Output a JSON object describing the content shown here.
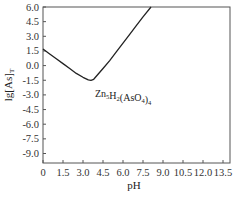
{
  "chart_data": {
    "type": "line",
    "title": "",
    "xlabel": "pH",
    "ylabel_main": "lg[As]",
    "ylabel_sub": "T",
    "xlim": [
      0,
      14.1
    ],
    "ylim": [
      -10.4,
      6.0
    ],
    "grid": false,
    "x_ticks": [
      "0",
      "1.5",
      "3.0",
      "4.5",
      "6.0",
      "7.5",
      "9.0",
      "10.5",
      "12.0",
      "13.5"
    ],
    "x_tick_values": [
      0,
      1.5,
      3.0,
      4.5,
      6.0,
      7.5,
      9.0,
      10.5,
      12.0,
      13.5
    ],
    "y_ticks": [
      "6.0",
      "4.5",
      "3.0",
      "1.5",
      "0.0",
      "-1.5",
      "-3.0",
      "-4.5",
      "-6.0",
      "-7.5",
      "-9.0"
    ],
    "y_tick_values": [
      6.0,
      4.5,
      3.0,
      1.5,
      0.0,
      -1.5,
      -3.0,
      -4.5,
      -6.0,
      -7.5,
      -9.0
    ],
    "series": [
      {
        "name": "Zn5H2(AsO4)4",
        "x": [
          0,
          0.5,
          1.0,
          1.5,
          2.0,
          2.5,
          3.0,
          3.4,
          3.6,
          3.8,
          4.0,
          4.5,
          5.0,
          5.5,
          6.0,
          6.5,
          7.0,
          7.5,
          8.1
        ],
        "y": [
          1.7,
          1.2,
          0.7,
          0.2,
          -0.3,
          -0.8,
          -1.2,
          -1.45,
          -1.5,
          -1.4,
          -1.1,
          -0.3,
          0.5,
          1.4,
          2.3,
          3.2,
          4.1,
          5.0,
          6.0
        ]
      }
    ],
    "annotations": [
      {
        "text_main": "Zn",
        "sub1": "5",
        "text2": "H",
        "sub2": "2",
        "text3": "(AsO",
        "sub3": "4",
        "text4": ")",
        "sub4": "4",
        "x": 3.9,
        "y": -3.0
      }
    ]
  }
}
